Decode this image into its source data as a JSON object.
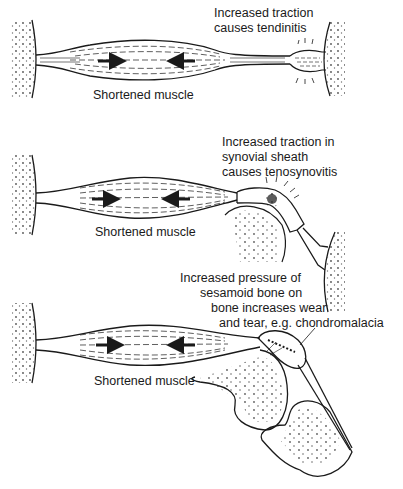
{
  "panels": [
    {
      "id": "tendinitis",
      "muscle_label": "Shortened muscle",
      "annotation": [
        "Increased traction",
        "causes tendinitis"
      ]
    },
    {
      "id": "tenosynovitis",
      "muscle_label": "Shortened muscle",
      "annotation": [
        "Increased traction in",
        "synovial sheath",
        "causes tenosynovitis"
      ]
    },
    {
      "id": "chondromalacia",
      "muscle_label": "Shortened muscle",
      "annotation": [
        "Increased pressure of",
        "sesamoid bone on",
        "bone increases wear",
        "and tear, e.g. chondromalacia"
      ]
    }
  ],
  "colors": {
    "ink": "#1a1a1a",
    "background": "#ffffff"
  }
}
